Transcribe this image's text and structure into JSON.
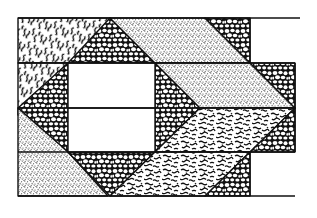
{
  "figure": {
    "width": 317,
    "height": 218,
    "background": "#ffffff",
    "ink": "#111111",
    "textures": [
      {
        "id": "stipple",
        "name": "Fine dot stipple (sand)"
      },
      {
        "id": "pebbles",
        "name": "Cobble / pebble pattern"
      },
      {
        "id": "vermiculate",
        "name": "Worm-like squiggle pattern"
      }
    ],
    "rows_y": [
      20,
      63,
      108,
      152,
      196
    ],
    "regions": [
      {
        "name": "top-left vermiculate block",
        "texture": "vermiculate"
      },
      {
        "name": "top pebble triangle",
        "texture": "pebbles"
      },
      {
        "name": "top stipple parallelogram",
        "texture": "stipple"
      },
      {
        "name": "top-right pebble triangle",
        "texture": "pebbles"
      },
      {
        "name": "left vermiculate triangle",
        "texture": "vermiculate"
      },
      {
        "name": "left pebble triangle",
        "texture": "pebbles"
      },
      {
        "name": "center white square",
        "texture": "none"
      },
      {
        "name": "right pebble triangle (upper)",
        "texture": "pebbles"
      },
      {
        "name": "middle stipple parallelogram",
        "texture": "stipple"
      },
      {
        "name": "far-right pebble triangle",
        "texture": "pebbles"
      },
      {
        "name": "lower-left stipple triangle",
        "texture": "stipple"
      },
      {
        "name": "lower-left pebble triangle",
        "texture": "pebbles"
      },
      {
        "name": "lower pebble triangle",
        "texture": "pebbles"
      },
      {
        "name": "right vermiculate parallelogram",
        "texture": "vermiculate"
      },
      {
        "name": "bottom vermiculate block",
        "texture": "vermiculate"
      },
      {
        "name": "bottom pebble triangle",
        "texture": "pebbles"
      }
    ]
  }
}
